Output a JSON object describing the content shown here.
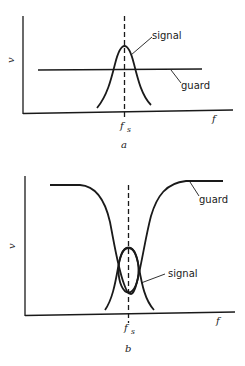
{
  "panels": [
    {
      "id": "a",
      "caption": "a",
      "y_axis_label": "v",
      "x_axis_label": "f",
      "marker_label": "f",
      "marker_subscript": "s",
      "curves": [
        {
          "name": "signal",
          "label": "signal",
          "shape": "narrow peak centered at f_s, rising above guard level"
        },
        {
          "name": "guard",
          "label": "guard",
          "shape": "flat horizontal line across frequency"
        }
      ]
    },
    {
      "id": "b",
      "caption": "b",
      "y_axis_label": "v",
      "x_axis_label": "f",
      "marker_label": "f",
      "marker_subscript": "s",
      "curves": [
        {
          "name": "guard",
          "label": "guard",
          "shape": "high everywhere except deep notch at f_s"
        },
        {
          "name": "signal",
          "label": "signal",
          "shape": "narrow peak at f_s inside guard notch (small loop)"
        }
      ]
    }
  ],
  "colors": {
    "ink": "#1a1a1a",
    "background": "#ffffff"
  }
}
